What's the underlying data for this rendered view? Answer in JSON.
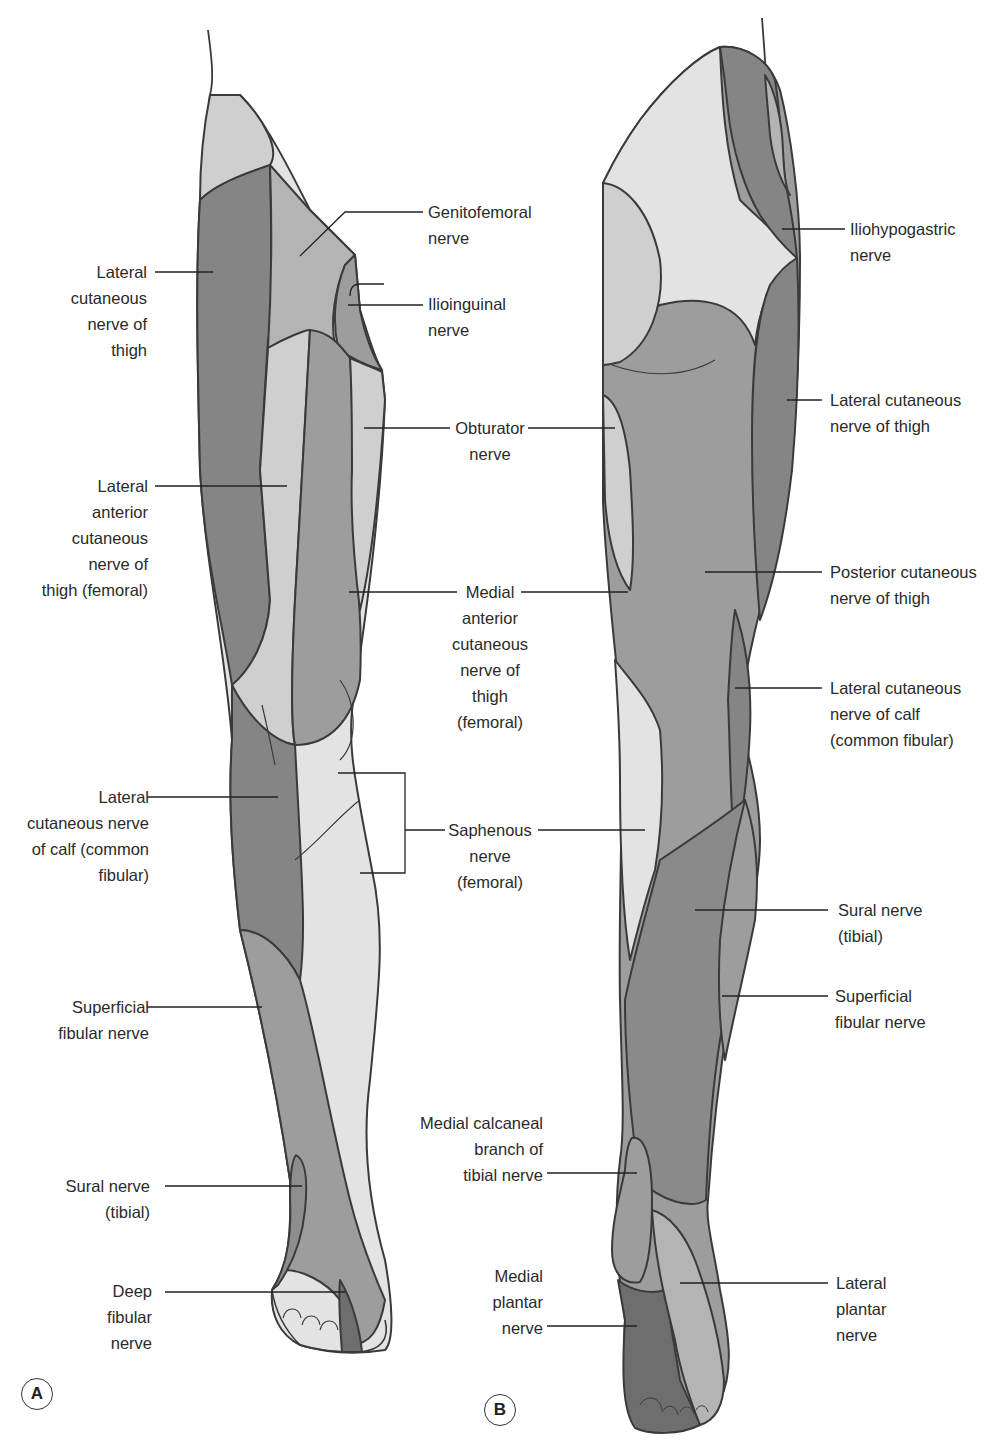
{
  "figure": {
    "colors": {
      "outline": "#3a3a3a",
      "darkest": "#6e6e6e",
      "dark": "#858585",
      "medium": "#9d9d9d",
      "light": "#b4b4b4",
      "lighter": "#cfcfcf",
      "palest": "#e3e3e3"
    },
    "panels": [
      {
        "id": "A",
        "view": "anterior",
        "badge": "A",
        "labels": [
          {
            "text": "Genitofemoral\nnerve",
            "side": "right"
          },
          {
            "text": "Ilioinguinal\nnerve",
            "side": "right"
          },
          {
            "text": "Lateral\ncutaneous\nnerve of\nthigh",
            "side": "left"
          },
          {
            "text": "Lateral\nanterior\ncutaneous\nnerve of\nthigh (femoral)",
            "side": "left"
          },
          {
            "text": "Lateral\ncutaneous nerve\nof calf (common\nfibular)",
            "side": "left"
          },
          {
            "text": "Superficial\nfibular nerve",
            "side": "left"
          },
          {
            "text": "Sural nerve\n(tibial)",
            "side": "left"
          },
          {
            "text": "Deep\nfibular\nnerve",
            "side": "left"
          }
        ]
      },
      {
        "id": "B",
        "view": "posterior",
        "badge": "B",
        "labels": [
          {
            "text": "Iliohypogastric\nnerve",
            "side": "right"
          },
          {
            "text": "Lateral cutaneous\nnerve of thigh",
            "side": "right"
          },
          {
            "text": "Posterior cutaneous\nnerve of thigh",
            "side": "right"
          },
          {
            "text": "Lateral cutaneous\nnerve of calf\n(common fibular)",
            "side": "right"
          },
          {
            "text": "Sural nerve\n(tibial)",
            "side": "right"
          },
          {
            "text": "Superficial\nfibular nerve",
            "side": "right"
          },
          {
            "text": "Medial calcaneal\nbranch of\ntibial nerve",
            "side": "left"
          },
          {
            "text": "Medial\nplantar\nnerve",
            "side": "left"
          },
          {
            "text": "Lateral\nplantar\nnerve",
            "side": "right"
          }
        ]
      }
    ],
    "shared_labels": [
      {
        "text": "Obturator\nnerve"
      },
      {
        "text": "Medial\nanterior\ncutaneous\nnerve of\nthigh\n(femoral)"
      },
      {
        "text": "Saphenous\nnerve\n(femoral)"
      }
    ]
  }
}
